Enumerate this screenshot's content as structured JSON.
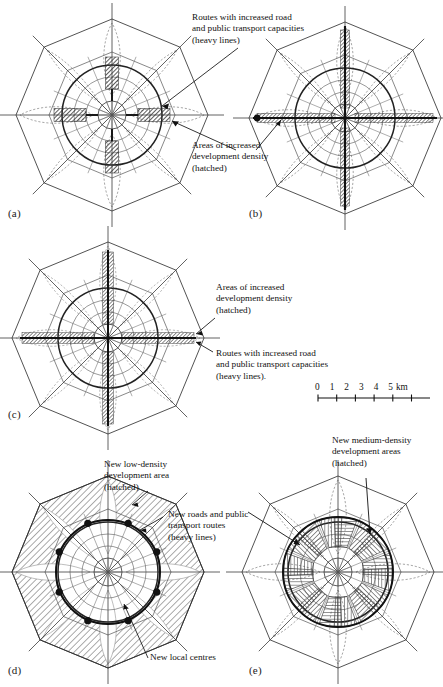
{
  "figure": {
    "type": "diagram-set",
    "panels": [
      {
        "id": "a",
        "label": "(a)",
        "annotations": [
          {
            "name": "routes-increased-capacity",
            "lines": [
              "Routes with increased road",
              "and public transport capacities",
              "(heavy lines)"
            ]
          },
          {
            "name": "areas-increased-density",
            "lines": [
              "Areas of increased",
              "development density",
              "(hatched)"
            ]
          }
        ]
      },
      {
        "id": "b",
        "label": "(b)",
        "annotations": []
      },
      {
        "id": "c",
        "label": "(c)",
        "annotations": [
          {
            "name": "areas-increased-density",
            "lines": [
              "Areas of increased",
              "development density",
              "(hatched)"
            ]
          },
          {
            "name": "routes-increased-capacity",
            "lines": [
              "Routes with increased road",
              "and public transport capacities",
              "(heavy lines)."
            ]
          }
        ]
      },
      {
        "id": "d",
        "label": "(d)",
        "annotations": [
          {
            "name": "new-low-density-area",
            "lines": [
              "New low-density",
              "development area",
              "(hatched)"
            ]
          },
          {
            "name": "new-roads-and-routes",
            "lines": [
              "New roads and public",
              "transport routes",
              "(heavy lines)"
            ]
          },
          {
            "name": "new-local-centres",
            "lines": [
              "New local centres"
            ]
          }
        ]
      },
      {
        "id": "e",
        "label": "(e)",
        "annotations": [
          {
            "name": "new-medium-density-areas",
            "lines": [
              "New medium-density",
              "development areas",
              "(hatched)"
            ]
          }
        ]
      }
    ],
    "scale_bar": {
      "name": "scale-bar",
      "ticks": [
        "0",
        "1",
        "2",
        "3",
        "4",
        "5"
      ],
      "unit": "km",
      "label": "0  1  2  3  4  5 km"
    },
    "colors": {
      "ink": "#111111",
      "line_light": "#6e6e6e",
      "line_medium": "#3a3a3a",
      "hatch": "#4a4a4a",
      "shade": "#8a8a8a",
      "background": "#ffffff"
    }
  }
}
